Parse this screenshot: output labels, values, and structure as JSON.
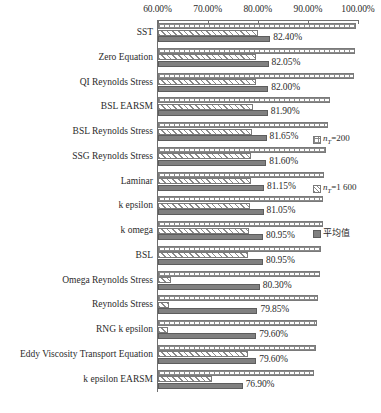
{
  "chart_data": {
    "type": "bar",
    "orientation": "horizontal",
    "title": "",
    "xlabel": "",
    "ylabel": "",
    "xlim": [
      60,
      100
    ],
    "xticks": [
      "60.00%",
      "70.00%",
      "80.00%",
      "90.00%",
      "100.00%"
    ],
    "xtick_values": [
      60,
      70,
      80,
      90,
      100
    ],
    "grid": false,
    "legend_position": "right",
    "categories": [
      "SST",
      "Zero Equation",
      "QI Reynolds Stress",
      "BSL EARSM",
      "BSL Reynolds Stress",
      "SSG Reynolds Stress",
      "Laminar",
      "k epsilon",
      "k omega",
      "BSL",
      "Omega Reynolds Stress",
      "Reynolds Stress",
      "RNG k epsilon",
      "Eddy Viscosity Transport Equation",
      "k epsilon EARSM"
    ],
    "series": [
      {
        "name": "n_T=200",
        "pattern": "grid",
        "values": [
          99.5,
          99.3,
          99.2,
          94.3,
          94.0,
          93.6,
          93.2,
          93.0,
          93.0,
          92.6,
          92.3,
          92.0,
          91.8,
          91.6,
          91.2
        ]
      },
      {
        "name": "n_T=1 600",
        "pattern": "diagonal-hatch",
        "values": [
          79.9,
          79.6,
          79.5,
          78.9,
          78.8,
          78.6,
          78.5,
          78.4,
          78.2,
          77.9,
          62.5,
          62.2,
          62.0,
          78.0,
          70.8
        ]
      },
      {
        "name": "average",
        "pattern": "solid",
        "values": [
          82.4,
          82.05,
          82.0,
          81.9,
          81.65,
          81.6,
          81.15,
          81.05,
          80.95,
          80.95,
          80.3,
          79.85,
          79.6,
          79.6,
          76.9
        ]
      }
    ],
    "value_labels": [
      "82.40%",
      "82.05%",
      "82.00%",
      "81.90%",
      "81.65%",
      "81.60%",
      "81.15%",
      "81.05%",
      "80.95%",
      "80.95%",
      "80.30%",
      "79.85%",
      "79.60%",
      "79.60%",
      "76.90%"
    ]
  },
  "legend": [
    {
      "swatch": "grid",
      "text_prefix": "n",
      "text_sub": "T",
      "text_suffix": "=200"
    },
    {
      "swatch": "hatch",
      "text_prefix": "n",
      "text_sub": "T",
      "text_suffix": "=1 600"
    },
    {
      "swatch": "solid",
      "text_prefix": "",
      "text_sub": "",
      "text_suffix": "平均值"
    }
  ],
  "colors": {
    "bar_solid": "#808080",
    "bar_outline": "#7a7a7a",
    "axis": "#6f6f6f",
    "text": "#2b2b2b",
    "background": "#ffffff"
  },
  "caption": ""
}
